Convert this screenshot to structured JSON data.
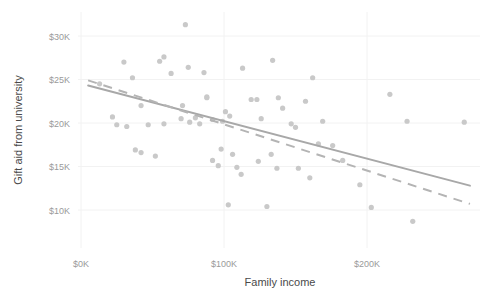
{
  "chart_data": {
    "type": "scatter",
    "title": "",
    "xlabel": "Family income",
    "ylabel": "Gift aid from university",
    "xlim": [
      -8000,
      278000
    ],
    "ylim": [
      7200,
      31800
    ],
    "grid": false,
    "legend": null,
    "xticks": [
      {
        "value": 0,
        "label": "$0K"
      },
      {
        "value": 100000,
        "label": "$100K"
      },
      {
        "value": 200000,
        "label": "$200K"
      }
    ],
    "yticks": [
      {
        "value": 10000,
        "label": "$10K"
      },
      {
        "value": 15000,
        "label": "$15K"
      },
      {
        "value": 20000,
        "label": "$20K"
      },
      {
        "value": 25000,
        "label": "$25K"
      },
      {
        "value": 30000,
        "label": "$30K"
      }
    ],
    "point_color": "#c9c9c9",
    "point_radius": 2.6,
    "points": [
      {
        "x": 73000,
        "y": 31300
      },
      {
        "x": 13000,
        "y": 24500
      },
      {
        "x": 22000,
        "y": 20700
      },
      {
        "x": 25000,
        "y": 19800
      },
      {
        "x": 32000,
        "y": 19600
      },
      {
        "x": 30000,
        "y": 27000
      },
      {
        "x": 42000,
        "y": 22000
      },
      {
        "x": 38000,
        "y": 16900
      },
      {
        "x": 42000,
        "y": 16600
      },
      {
        "x": 47000,
        "y": 19800
      },
      {
        "x": 36000,
        "y": 25200
      },
      {
        "x": 55000,
        "y": 27100
      },
      {
        "x": 58000,
        "y": 27600
      },
      {
        "x": 52000,
        "y": 16200
      },
      {
        "x": 58000,
        "y": 19900
      },
      {
        "x": 63000,
        "y": 25700
      },
      {
        "x": 71000,
        "y": 22000
      },
      {
        "x": 75000,
        "y": 26400
      },
      {
        "x": 70000,
        "y": 20500
      },
      {
        "x": 76000,
        "y": 20100
      },
      {
        "x": 80000,
        "y": 20600
      },
      {
        "x": 83000,
        "y": 19900
      },
      {
        "x": 86000,
        "y": 25800
      },
      {
        "x": 88000,
        "y": 23000
      },
      {
        "x": 88000,
        "y": 22900
      },
      {
        "x": 92000,
        "y": 20400
      },
      {
        "x": 92000,
        "y": 15700
      },
      {
        "x": 96000,
        "y": 15100
      },
      {
        "x": 99000,
        "y": 20200
      },
      {
        "x": 101000,
        "y": 21300
      },
      {
        "x": 104000,
        "y": 20800
      },
      {
        "x": 98000,
        "y": 17000
      },
      {
        "x": 106000,
        "y": 16400
      },
      {
        "x": 109000,
        "y": 14900
      },
      {
        "x": 112000,
        "y": 14100
      },
      {
        "x": 103000,
        "y": 10600
      },
      {
        "x": 113000,
        "y": 26300
      },
      {
        "x": 119000,
        "y": 22700
      },
      {
        "x": 123000,
        "y": 22700
      },
      {
        "x": 124000,
        "y": 15600
      },
      {
        "x": 126000,
        "y": 20500
      },
      {
        "x": 130000,
        "y": 10400
      },
      {
        "x": 134000,
        "y": 27200
      },
      {
        "x": 138000,
        "y": 22900
      },
      {
        "x": 133000,
        "y": 16400
      },
      {
        "x": 137000,
        "y": 14800
      },
      {
        "x": 141000,
        "y": 21700
      },
      {
        "x": 147000,
        "y": 19900
      },
      {
        "x": 150000,
        "y": 19500
      },
      {
        "x": 152000,
        "y": 14800
      },
      {
        "x": 157000,
        "y": 22500
      },
      {
        "x": 162000,
        "y": 25200
      },
      {
        "x": 160000,
        "y": 13700
      },
      {
        "x": 169000,
        "y": 20200
      },
      {
        "x": 166000,
        "y": 17600
      },
      {
        "x": 176000,
        "y": 17400
      },
      {
        "x": 183000,
        "y": 15700
      },
      {
        "x": 195000,
        "y": 12900
      },
      {
        "x": 203000,
        "y": 10300
      },
      {
        "x": 216000,
        "y": 23300
      },
      {
        "x": 228000,
        "y": 20200
      },
      {
        "x": 232000,
        "y": 8700
      },
      {
        "x": 268000,
        "y": 20100
      }
    ],
    "fit_lines": [
      {
        "name": "solid-fit-line",
        "style": "solid",
        "color": "#a8a8a8",
        "x1": 5000,
        "y1": 24300,
        "x2": 272000,
        "y2": 12800
      },
      {
        "name": "dashed-fit-line",
        "style": "dashed",
        "color": "#b4b4b4",
        "x1": 5000,
        "y1": 24900,
        "x2": 272000,
        "y2": 10700
      }
    ]
  }
}
